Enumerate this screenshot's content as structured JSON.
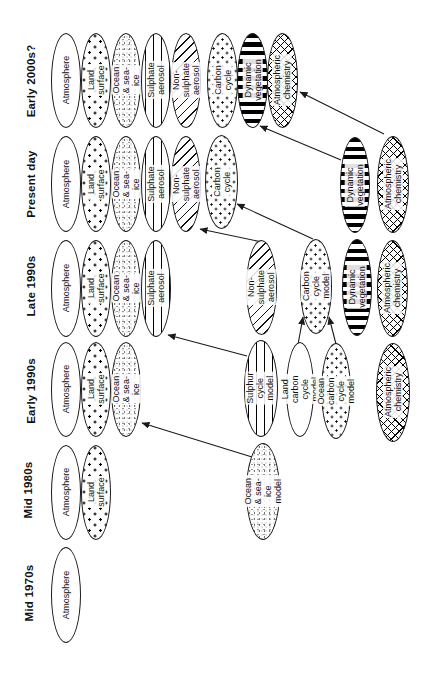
{
  "figure": {
    "width": 431,
    "height": 689,
    "background": "#ffffff",
    "ink": "#111111"
  },
  "eras": [
    {
      "id": "mid-1970s",
      "label": "Mid 1970s",
      "cx": 29,
      "cy": 593
    },
    {
      "id": "mid-1980s",
      "label": "Mid 1980s",
      "cx": 28,
      "cy": 490
    },
    {
      "id": "early-1990s",
      "label": "Early 1990s",
      "cx": 31,
      "cy": 391
    },
    {
      "id": "late-1990s",
      "label": "Late 1990s",
      "cx": 31,
      "cy": 286
    },
    {
      "id": "present-day",
      "label": "Present day",
      "cx": 31,
      "cy": 184
    },
    {
      "id": "early-2000s",
      "label": "Early 2000s?",
      "cx": 31,
      "cy": 81
    }
  ],
  "nodes": [
    {
      "id": "2000s-atmosphere",
      "era": "early-2000s",
      "label": "Atmosphere",
      "pattern": "plain",
      "x": 51,
      "y": 33,
      "w": 30,
      "h": 95
    },
    {
      "id": "2000s-land-surface",
      "era": "early-2000s",
      "label": "Land surface",
      "pattern": "dots",
      "x": 81,
      "y": 33,
      "w": 30,
      "h": 95
    },
    {
      "id": "2000s-ocean-sea-ice",
      "era": "early-2000s",
      "label": "Ocean & sea-ice",
      "pattern": "speckle",
      "x": 111,
      "y": 33,
      "w": 30,
      "h": 95
    },
    {
      "id": "2000s-sulphate-aerosol",
      "era": "early-2000s",
      "label": "Sulphate aerosol",
      "pattern": "vlines",
      "x": 141,
      "y": 33,
      "w": 30,
      "h": 95
    },
    {
      "id": "2000s-non-sulphate",
      "era": "early-2000s",
      "label": "Non-sulphate\naerosol",
      "pattern": "diag",
      "x": 171,
      "y": 33,
      "w": 30,
      "h": 95
    },
    {
      "id": "2000s-carbon-cycle",
      "era": "early-2000s",
      "label": "Carbon cycle",
      "pattern": "dots2",
      "x": 207,
      "y": 33,
      "w": 31,
      "h": 95
    },
    {
      "id": "2000s-dynamic-veg",
      "era": "early-2000s",
      "label": "Dynamic\nvegetation",
      "pattern": "stripes",
      "x": 237,
      "y": 33,
      "w": 31,
      "h": 95
    },
    {
      "id": "2000s-atm-chemistry",
      "era": "early-2000s",
      "label": "Atmospheric\nchemistry",
      "pattern": "cross",
      "x": 267,
      "y": 33,
      "w": 31,
      "h": 95
    },
    {
      "id": "present-atmosphere",
      "era": "present-day",
      "label": "Atmosphere",
      "pattern": "plain",
      "x": 51,
      "y": 136,
      "w": 30,
      "h": 96
    },
    {
      "id": "present-land-surface",
      "era": "present-day",
      "label": "Land surface",
      "pattern": "dots",
      "x": 81,
      "y": 136,
      "w": 30,
      "h": 96
    },
    {
      "id": "present-ocean-sea-ice",
      "era": "present-day",
      "label": "Ocean & sea-ice",
      "pattern": "speckle",
      "x": 111,
      "y": 136,
      "w": 30,
      "h": 96
    },
    {
      "id": "present-sulphate-aerosol",
      "era": "present-day",
      "label": "Sulphate aerosol",
      "pattern": "vlines",
      "x": 141,
      "y": 136,
      "w": 30,
      "h": 96
    },
    {
      "id": "present-non-sulphate",
      "era": "present-day",
      "label": "Non-sulphate\naerosol",
      "pattern": "diag",
      "x": 171,
      "y": 136,
      "w": 30,
      "h": 96
    },
    {
      "id": "present-carbon-cycle",
      "era": "present-day",
      "label": "Carbon cycle",
      "pattern": "dots2",
      "x": 205,
      "y": 135,
      "w": 33,
      "h": 94
    },
    {
      "id": "present-dynamic-veg",
      "era": "present-day",
      "label": "Dynamic\nvegetation",
      "pattern": "stripes",
      "x": 340,
      "y": 137,
      "w": 30,
      "h": 96
    },
    {
      "id": "present-atm-chemistry",
      "era": "present-day",
      "label": "Atmospheric\nchemistry",
      "pattern": "cross",
      "x": 377,
      "y": 136,
      "w": 32,
      "h": 97
    },
    {
      "id": "late90s-atmosphere",
      "era": "late-1990s",
      "label": "Atmosphere",
      "pattern": "plain",
      "x": 51,
      "y": 240,
      "w": 30,
      "h": 97
    },
    {
      "id": "late90s-land-surface",
      "era": "late-1990s",
      "label": "Land surface",
      "pattern": "dots",
      "x": 81,
      "y": 240,
      "w": 30,
      "h": 97
    },
    {
      "id": "late90s-ocean-sea-ice",
      "era": "late-1990s",
      "label": "Ocean & sea-ice",
      "pattern": "speckle",
      "x": 111,
      "y": 240,
      "w": 30,
      "h": 97
    },
    {
      "id": "late90s-sulphate-aerosol",
      "era": "late-1990s",
      "label": "Sulphate aerosol",
      "pattern": "vlines",
      "x": 141,
      "y": 240,
      "w": 30,
      "h": 97
    },
    {
      "id": "late90s-non-sulphate",
      "era": "late-1990s",
      "label": "Non-sulphate\naerosol",
      "pattern": "diag",
      "x": 246,
      "y": 240,
      "w": 31,
      "h": 95
    },
    {
      "id": "late90s-carbon-cycle-model",
      "era": "late-1990s",
      "label": "Carbon cycle\nmodel",
      "pattern": "dots2",
      "x": 300,
      "y": 239,
      "w": 32,
      "h": 95
    },
    {
      "id": "late90s-dynamic-veg",
      "era": "late-1990s",
      "label": "Dynamic\nvegetation",
      "pattern": "stripes",
      "x": 342,
      "y": 239,
      "w": 30,
      "h": 97
    },
    {
      "id": "late90s-atm-chemistry",
      "era": "late-1990s",
      "label": "Atmospheric\nchemistry",
      "pattern": "cross",
      "x": 377,
      "y": 240,
      "w": 31,
      "h": 97
    },
    {
      "id": "early90s-atmosphere",
      "era": "early-1990s",
      "label": "Atmosphere",
      "pattern": "plain",
      "x": 51,
      "y": 342,
      "w": 30,
      "h": 95
    },
    {
      "id": "early90s-land-surface",
      "era": "early-1990s",
      "label": "Land surface",
      "pattern": "dots",
      "x": 81,
      "y": 342,
      "w": 30,
      "h": 95
    },
    {
      "id": "early90s-ocean-sea-ice",
      "era": "early-1990s",
      "label": "Ocean & sea-ice",
      "pattern": "speckle",
      "x": 111,
      "y": 342,
      "w": 30,
      "h": 95
    },
    {
      "id": "early90s-sulphur-cycle-model",
      "era": "early-1990s",
      "label": "Sulphur cycle\nmodel",
      "pattern": "vlines",
      "x": 244,
      "y": 340,
      "w": 34,
      "h": 97
    },
    {
      "id": "early90s-land-carbon-model",
      "era": "early-1990s",
      "label": "Land carbon\ncycle model",
      "pattern": "plain",
      "x": 286,
      "y": 342,
      "w": 28,
      "h": 95
    },
    {
      "id": "early90s-ocean-carbon-model",
      "era": "early-1990s",
      "label": "Ocean carbon\ncycle model",
      "pattern": "dots2",
      "x": 321,
      "y": 343,
      "w": 30,
      "h": 96
    },
    {
      "id": "early90s-atm-chemistry",
      "era": "early-1990s",
      "label": "Atmospheric\nchemistry",
      "pattern": "cross",
      "x": 376,
      "y": 343,
      "w": 34,
      "h": 99
    },
    {
      "id": "mid80s-atmosphere",
      "era": "mid-1980s",
      "label": "Atmosphere",
      "pattern": "plain",
      "x": 51,
      "y": 445,
      "w": 30,
      "h": 95
    },
    {
      "id": "mid80s-land-surface",
      "era": "mid-1980s",
      "label": "Land surface",
      "pattern": "dots",
      "x": 81,
      "y": 445,
      "w": 30,
      "h": 95
    },
    {
      "id": "mid80s-ocean-sea-ice-model",
      "era": "mid-1980s",
      "label": "Ocean & sea-ice\nmodel",
      "pattern": "speckle",
      "x": 246,
      "y": 443,
      "w": 34,
      "h": 97
    },
    {
      "id": "mid70s-atmosphere",
      "era": "mid-1970s",
      "label": "Atmosphere",
      "pattern": "plain",
      "x": 51,
      "y": 547,
      "w": 30,
      "h": 96
    }
  ],
  "arrows": [
    {
      "from": "mid80s-ocean-sea-ice-model",
      "to": "early90s-ocean-sea-ice",
      "x1": 252,
      "y1": 457,
      "x2": 142,
      "y2": 423
    },
    {
      "from": "early90s-sulphur-cycle-model",
      "to": "late90s-sulphate-aerosol",
      "x1": 247,
      "y1": 356,
      "x2": 168,
      "y2": 335
    },
    {
      "from": "early90s-land-carbon-model",
      "to": "late90s-carbon-cycle-model",
      "x1": 297,
      "y1": 350,
      "x2": 303,
      "y2": 317
    },
    {
      "from": "early90s-ocean-carbon-model",
      "to": "late90s-carbon-cycle-model",
      "x1": 337,
      "y1": 348,
      "x2": 329,
      "y2": 317
    },
    {
      "from": "late90s-non-sulphate",
      "to": "present-non-sulphate",
      "x1": 262,
      "y1": 242,
      "x2": 200,
      "y2": 229
    },
    {
      "from": "late90s-carbon-cycle-model",
      "to": "present-carbon-cycle",
      "x1": 313,
      "y1": 239,
      "x2": 237,
      "y2": 204
    },
    {
      "from": "present-dynamic-veg",
      "to": "2000s-dynamic-veg",
      "x1": 341,
      "y1": 160,
      "x2": 260,
      "y2": 126
    },
    {
      "from": "present-atm-chemistry",
      "to": "2000s-atm-chemistry",
      "x1": 384,
      "y1": 134,
      "x2": 300,
      "y2": 92
    }
  ]
}
